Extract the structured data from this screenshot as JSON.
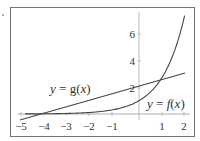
{
  "chart_data": {
    "type": "line",
    "title": "",
    "xlabel": "x",
    "ylabel": "y",
    "xlim": [
      -5,
      2
    ],
    "ylim": [
      -0.5,
      7.6
    ],
    "x_ticks": [
      "-5",
      "-4",
      "-3",
      "-2",
      "-1",
      "1",
      "2"
    ],
    "y_ticks": [
      "2",
      "4",
      "6"
    ],
    "grid": false,
    "series": [
      {
        "name": "y = f(x)",
        "expression": "e^x",
        "x": [
          -5,
          -4,
          -3,
          -2,
          -1,
          0,
          0.5,
          1,
          1.5,
          2
        ],
        "values": [
          0.007,
          0.018,
          0.05,
          0.14,
          0.37,
          1.0,
          1.65,
          2.72,
          4.48,
          7.39
        ]
      },
      {
        "name": "y = g(x)",
        "expression": "(x+4)/2",
        "x": [
          -5,
          -4,
          0,
          2
        ],
        "values": [
          -0.5,
          0,
          2,
          3
        ]
      }
    ],
    "annotations": [
      {
        "text": "y = g(x)",
        "x": -3.6,
        "y": 2.0
      },
      {
        "text": "y = f(x)",
        "x": 0.35,
        "y": 0.6
      }
    ]
  },
  "labels": {
    "g": {
      "y": "y",
      "eq": " = ",
      "fn": "g",
      "open": "(",
      "x": "x",
      "close": ")"
    },
    "f": {
      "y": "y",
      "eq": " = ",
      "fn": "f",
      "open": "(",
      "x": "x",
      "close": ")"
    }
  },
  "ticks": {
    "x": [
      "−5",
      "−4",
      "−3",
      "−2",
      "−1",
      "1",
      "2"
    ],
    "y": [
      "2",
      "4",
      "6"
    ]
  }
}
